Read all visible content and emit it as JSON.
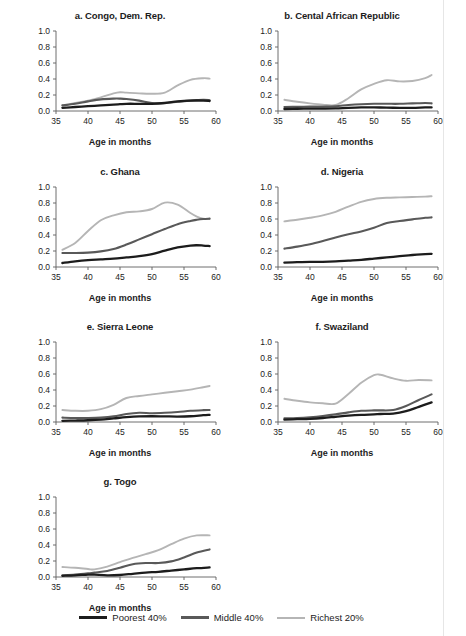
{
  "figure": {
    "axis_title": "Age in months",
    "page_edge_color": "#e6e6e6"
  },
  "legend": {
    "items": [
      {
        "label": "Poorest 40%",
        "color": "#1c1c1c",
        "key": "poorest"
      },
      {
        "label": "Middle 40%",
        "color": "#595959",
        "key": "middle"
      },
      {
        "label": "Richest 20%",
        "color": "#b5b5b5",
        "key": "richest"
      }
    ]
  },
  "chart_data": [
    {
      "type": "line",
      "title": "a. Congo, Dem. Rep.",
      "xlabel": "Age in months",
      "ylabel": "",
      "xlim": [
        35,
        60
      ],
      "ylim": [
        0.0,
        1.0
      ],
      "xticks": [
        35,
        40,
        45,
        50,
        55,
        60
      ],
      "yticks": [
        "0.0",
        "0.2",
        "0.4",
        "0.6",
        "0.8",
        "1.0"
      ],
      "grid": false,
      "x": [
        36,
        38,
        40,
        42,
        44,
        45,
        46,
        48,
        50,
        52,
        54,
        56,
        58,
        59
      ],
      "series": [
        {
          "name": "Poorest 40%",
          "color": "#1c1c1c",
          "values": [
            0.04,
            0.05,
            0.06,
            0.07,
            0.08,
            0.085,
            0.09,
            0.09,
            0.09,
            0.1,
            0.12,
            0.13,
            0.13,
            0.125
          ]
        },
        {
          "name": "Middle 40%",
          "color": "#595959",
          "values": [
            0.07,
            0.09,
            0.12,
            0.145,
            0.155,
            0.155,
            0.15,
            0.13,
            0.1,
            0.1,
            0.115,
            0.13,
            0.14,
            0.135
          ]
        },
        {
          "name": "Richest 20%",
          "color": "#b5b5b5",
          "values": [
            0.07,
            0.1,
            0.13,
            0.17,
            0.22,
            0.235,
            0.23,
            0.22,
            0.215,
            0.23,
            0.32,
            0.39,
            0.41,
            0.405
          ]
        }
      ]
    },
    {
      "type": "line",
      "title": "b. Cental African Republic",
      "xlabel": "Age in months",
      "ylabel": "",
      "xlim": [
        35,
        60
      ],
      "ylim": [
        0.0,
        1.0
      ],
      "xticks": [
        35,
        40,
        45,
        50,
        55,
        60
      ],
      "yticks": [
        "0.0",
        "0.2",
        "0.4",
        "0.6",
        "0.8",
        "1.0"
      ],
      "grid": false,
      "x": [
        36,
        38,
        40,
        42,
        44,
        46,
        48,
        50,
        52,
        54,
        56,
        58,
        59
      ],
      "series": [
        {
          "name": "Poorest 40%",
          "color": "#1c1c1c",
          "values": [
            0.025,
            0.028,
            0.03,
            0.03,
            0.032,
            0.04,
            0.045,
            0.045,
            0.042,
            0.04,
            0.04,
            0.045,
            0.045
          ]
        },
        {
          "name": "Middle 40%",
          "color": "#595959",
          "values": [
            0.05,
            0.052,
            0.055,
            0.055,
            0.06,
            0.075,
            0.085,
            0.09,
            0.09,
            0.09,
            0.095,
            0.1,
            0.095
          ]
        },
        {
          "name": "Richest 20%",
          "color": "#b5b5b5",
          "values": [
            0.14,
            0.115,
            0.095,
            0.08,
            0.075,
            0.16,
            0.27,
            0.34,
            0.385,
            0.37,
            0.375,
            0.41,
            0.45
          ]
        }
      ]
    },
    {
      "type": "line",
      "title": "c. Ghana",
      "xlabel": "Age in months",
      "ylabel": "",
      "xlim": [
        35,
        60
      ],
      "ylim": [
        0.0,
        1.0
      ],
      "xticks": [
        35,
        40,
        45,
        50,
        55,
        60
      ],
      "yticks": [
        "0.0",
        "0.2",
        "0.4",
        "0.6",
        "0.8",
        "1.0"
      ],
      "grid": false,
      "x": [
        36,
        38,
        40,
        42,
        44,
        46,
        48,
        50,
        52,
        54,
        56,
        57,
        58,
        59
      ],
      "series": [
        {
          "name": "Poorest 40%",
          "color": "#1c1c1c",
          "values": [
            0.05,
            0.07,
            0.085,
            0.095,
            0.105,
            0.12,
            0.135,
            0.16,
            0.205,
            0.245,
            0.268,
            0.272,
            0.268,
            0.262
          ]
        },
        {
          "name": "Middle 40%",
          "color": "#595959",
          "values": [
            0.175,
            0.175,
            0.18,
            0.195,
            0.225,
            0.28,
            0.345,
            0.41,
            0.475,
            0.535,
            0.575,
            0.59,
            0.6,
            0.605
          ]
        },
        {
          "name": "Richest 20%",
          "color": "#b5b5b5",
          "values": [
            0.215,
            0.3,
            0.45,
            0.585,
            0.645,
            0.685,
            0.695,
            0.725,
            0.805,
            0.78,
            0.675,
            0.63,
            0.605,
            0.6
          ]
        }
      ]
    },
    {
      "type": "line",
      "title": "d. Nigeria",
      "xlabel": "Age in months",
      "ylabel": "",
      "xlim": [
        35,
        60
      ],
      "ylim": [
        0.0,
        1.0
      ],
      "xticks": [
        35,
        40,
        45,
        50,
        55,
        60
      ],
      "yticks": [
        "0.0",
        "0.2",
        "0.4",
        "0.6",
        "0.8",
        "1.0"
      ],
      "grid": false,
      "x": [
        36,
        38,
        40,
        42,
        44,
        46,
        48,
        50,
        52,
        54,
        56,
        58,
        59
      ],
      "series": [
        {
          "name": "Poorest 40%",
          "color": "#1c1c1c",
          "values": [
            0.055,
            0.06,
            0.065,
            0.065,
            0.07,
            0.08,
            0.09,
            0.105,
            0.12,
            0.135,
            0.15,
            0.162,
            0.165
          ]
        },
        {
          "name": "Middle 40%",
          "color": "#595959",
          "values": [
            0.23,
            0.255,
            0.285,
            0.325,
            0.37,
            0.41,
            0.445,
            0.49,
            0.55,
            0.575,
            0.595,
            0.615,
            0.62
          ]
        },
        {
          "name": "Richest 20%",
          "color": "#b5b5b5",
          "values": [
            0.57,
            0.59,
            0.615,
            0.645,
            0.69,
            0.755,
            0.815,
            0.85,
            0.865,
            0.87,
            0.875,
            0.88,
            0.885
          ]
        }
      ]
    },
    {
      "type": "line",
      "title": "e. Sierra Leone",
      "xlabel": "Age in months",
      "ylabel": "",
      "xlim": [
        35,
        60
      ],
      "ylim": [
        0.0,
        1.0
      ],
      "xticks": [
        35,
        40,
        45,
        50,
        55,
        60
      ],
      "yticks": [
        "0.0",
        "0.2",
        "0.4",
        "0.6",
        "0.8",
        "1.0"
      ],
      "grid": false,
      "x": [
        36,
        38,
        40,
        42,
        44,
        46,
        48,
        50,
        52,
        54,
        56,
        58,
        59
      ],
      "series": [
        {
          "name": "Poorest 40%",
          "color": "#1c1c1c",
          "values": [
            0.015,
            0.018,
            0.022,
            0.03,
            0.045,
            0.06,
            0.07,
            0.072,
            0.07,
            0.068,
            0.072,
            0.085,
            0.09
          ]
        },
        {
          "name": "Middle 40%",
          "color": "#595959",
          "values": [
            0.055,
            0.05,
            0.05,
            0.055,
            0.07,
            0.1,
            0.115,
            0.11,
            0.115,
            0.125,
            0.14,
            0.148,
            0.15
          ]
        },
        {
          "name": "Richest 20%",
          "color": "#b5b5b5",
          "values": [
            0.15,
            0.14,
            0.14,
            0.16,
            0.215,
            0.3,
            0.325,
            0.345,
            0.365,
            0.385,
            0.405,
            0.435,
            0.45
          ]
        }
      ]
    },
    {
      "type": "line",
      "title": "f. Swaziland",
      "xlabel": "Age in months",
      "ylabel": "",
      "xlim": [
        35,
        60
      ],
      "ylim": [
        0.0,
        1.0
      ],
      "xticks": [
        35,
        40,
        45,
        50,
        55,
        60
      ],
      "yticks": [
        "0.0",
        "0.2",
        "0.4",
        "0.6",
        "0.8",
        "1.0"
      ],
      "grid": false,
      "x": [
        36,
        38,
        40,
        42,
        44,
        46,
        48,
        50,
        51,
        53,
        55,
        57,
        59
      ],
      "series": [
        {
          "name": "Poorest 40%",
          "color": "#1c1c1c",
          "values": [
            0.03,
            0.035,
            0.04,
            0.05,
            0.065,
            0.08,
            0.09,
            0.095,
            0.1,
            0.105,
            0.135,
            0.19,
            0.245
          ]
        },
        {
          "name": "Middle 40%",
          "color": "#595959",
          "values": [
            0.045,
            0.05,
            0.06,
            0.075,
            0.095,
            0.12,
            0.14,
            0.145,
            0.145,
            0.15,
            0.2,
            0.275,
            0.345
          ]
        },
        {
          "name": "Richest 20%",
          "color": "#b5b5b5",
          "values": [
            0.29,
            0.265,
            0.245,
            0.235,
            0.23,
            0.35,
            0.49,
            0.585,
            0.59,
            0.545,
            0.515,
            0.525,
            0.52
          ]
        }
      ]
    },
    {
      "type": "line",
      "title": "g. Togo",
      "xlabel": "Age in months",
      "ylabel": "",
      "xlim": [
        35,
        60
      ],
      "ylim": [
        0.0,
        1.0
      ],
      "xticks": [
        35,
        40,
        45,
        50,
        55,
        60
      ],
      "yticks": [
        "0.0",
        "0.2",
        "0.4",
        "0.6",
        "0.8",
        "1.0"
      ],
      "grid": false,
      "x": [
        36,
        38,
        40,
        41,
        43,
        45,
        47,
        49,
        51,
        53,
        55,
        57,
        59
      ],
      "series": [
        {
          "name": "Poorest 40%",
          "color": "#1c1c1c",
          "values": [
            0.015,
            0.02,
            0.03,
            0.03,
            0.02,
            0.025,
            0.04,
            0.055,
            0.065,
            0.08,
            0.095,
            0.11,
            0.12
          ]
        },
        {
          "name": "Middle 40%",
          "color": "#595959",
          "values": [
            0.02,
            0.03,
            0.045,
            0.055,
            0.075,
            0.115,
            0.16,
            0.175,
            0.175,
            0.195,
            0.245,
            0.305,
            0.345
          ]
        },
        {
          "name": "Richest 20%",
          "color": "#b5b5b5",
          "values": [
            0.125,
            0.115,
            0.1,
            0.095,
            0.13,
            0.185,
            0.24,
            0.285,
            0.335,
            0.41,
            0.48,
            0.52,
            0.52
          ]
        }
      ]
    }
  ]
}
